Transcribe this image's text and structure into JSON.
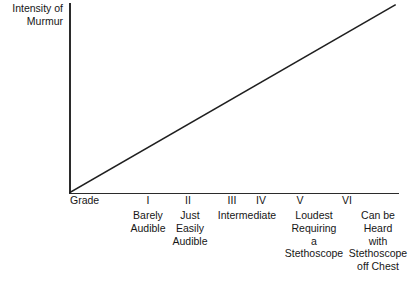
{
  "figure": {
    "y_axis_label": "Intensity of\nMurmur",
    "grade_word": "Grade",
    "caption": ""
  },
  "chart_data": {
    "type": "line",
    "title": "",
    "xlabel": "Grade",
    "ylabel": "Intensity of Murmur",
    "grid": false,
    "legend": "none",
    "xlim": [
      0,
      6
    ],
    "ylim": [
      0,
      6
    ],
    "categories": [
      "Grade",
      "I",
      "II",
      "III",
      "IV",
      "V",
      "VI"
    ],
    "tick_labels": [
      "I",
      "II",
      "III",
      "IV",
      "V",
      "VI"
    ],
    "tick_descriptions": [
      "Barely\nAudible",
      "Just\nEasily\nAudible",
      "Intermediate",
      "",
      "Loudest\nRequiring\na\nStethoscope",
      "Can be\nHeard\nwith\nStethoscope\noff Chest"
    ],
    "series": [
      {
        "name": "Intensity",
        "x": [
          0,
          6
        ],
        "values": [
          0,
          6
        ],
        "style": "straight-line",
        "color": "#1f1f1f"
      }
    ],
    "annotations": [],
    "axis_color": "#2b2b2b",
    "line_color": "#1f1f1f",
    "background": "#ffffff"
  },
  "ticks": [
    {
      "label": "I",
      "x": 148,
      "desc": "Barely\nAudible",
      "desc_x": 148,
      "desc_w": 62
    },
    {
      "label": "II",
      "x": 188,
      "desc": "Just\nEasily\nAudible",
      "desc_x": 190,
      "desc_w": 52
    },
    {
      "label": "III",
      "x": 232,
      "desc": "",
      "desc_x": 232,
      "desc_w": 30
    },
    {
      "label": "IV",
      "x": 261,
      "desc": "Intermediate",
      "desc_x": 247,
      "desc_w": 76
    },
    {
      "label": "V",
      "x": 300,
      "desc": "Loudest\nRequiring\na\nStethoscope",
      "desc_x": 314,
      "desc_w": 76
    },
    {
      "label": "VI",
      "x": 347,
      "desc": "Can be\nHeard\nwith\nStethoscope\noff Chest",
      "desc_x": 378,
      "desc_w": 78
    }
  ]
}
